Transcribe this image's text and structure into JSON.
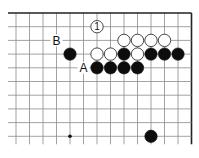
{
  "diagram": {
    "type": "go-board-fragment",
    "grid": {
      "columns": 14,
      "rows": 10,
      "origin_x": 16,
      "origin_y": 13,
      "spacing_x": 13.5,
      "spacing_y": 13.7,
      "edges": {
        "top": true,
        "right": true,
        "left": false,
        "bottom": false
      },
      "line_color": "#8a8a8a",
      "edge_color": "#222222"
    },
    "hoshi": [
      {
        "col": 4,
        "row": 9
      }
    ],
    "stones": [
      {
        "col": 6,
        "row": 1,
        "color": "white",
        "label": "1"
      },
      {
        "col": 8,
        "row": 2,
        "color": "white"
      },
      {
        "col": 9,
        "row": 2,
        "color": "white"
      },
      {
        "col": 10,
        "row": 2,
        "color": "white"
      },
      {
        "col": 11,
        "row": 2,
        "color": "white"
      },
      {
        "col": 4,
        "row": 3,
        "color": "black"
      },
      {
        "col": 6,
        "row": 3,
        "color": "white"
      },
      {
        "col": 7,
        "row": 3,
        "color": "white"
      },
      {
        "col": 8,
        "row": 3,
        "color": "black"
      },
      {
        "col": 9,
        "row": 3,
        "color": "white"
      },
      {
        "col": 10,
        "row": 3,
        "color": "black"
      },
      {
        "col": 11,
        "row": 3,
        "color": "black"
      },
      {
        "col": 12,
        "row": 3,
        "color": "black"
      },
      {
        "col": 6,
        "row": 4,
        "color": "black"
      },
      {
        "col": 7,
        "row": 4,
        "color": "black"
      },
      {
        "col": 8,
        "row": 4,
        "color": "black"
      },
      {
        "col": 9,
        "row": 4,
        "color": "black"
      },
      {
        "col": 10,
        "row": 9,
        "color": "black"
      }
    ],
    "labels": [
      {
        "col": 3,
        "row": 2,
        "text": "B"
      },
      {
        "col": 5,
        "row": 4,
        "text": "A"
      }
    ]
  }
}
